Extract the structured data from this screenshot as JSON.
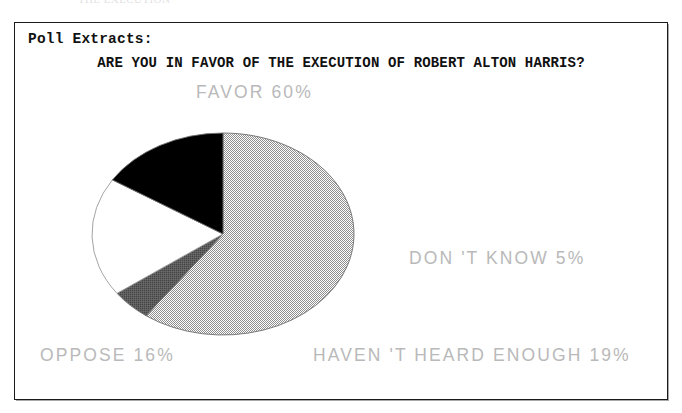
{
  "page": {
    "clipped_header_text": "THE EXECUTION"
  },
  "panel": {
    "section_label": "Poll Extracts:",
    "question": "ARE YOU IN FAVOR OF THE EXECUTION OF ROBERT ALTON HARRIS?"
  },
  "labels": {
    "favor": "FAVOR 60%",
    "dont_know": "DON 'T KNOW 5%",
    "oppose": "OPPOSE 16%",
    "havent_heard_enough": "HAVEN 'T HEARD ENOUGH 19%"
  },
  "chart_data": {
    "type": "pie",
    "title": "ARE YOU IN FAVOR OF THE EXECUTION OF ROBERT ALTON HARRIS?",
    "xlabel": "",
    "ylabel": "",
    "grid": false,
    "legend": "none",
    "value_unit": "percent",
    "total": 100,
    "center": [
      223,
      234
    ],
    "radius_x": 131,
    "radius_y": 101,
    "start_angle_deg": 0,
    "direction": "clockwise",
    "categories": [
      "FAVOR",
      "DON'T KNOW",
      "HAVEN'T HEARD ENOUGH",
      "OPPOSE"
    ],
    "values": [
      60,
      5,
      19,
      16
    ],
    "slices": [
      {
        "name": "FAVOR",
        "label": "FAVOR 60%",
        "value": 60,
        "fill": "#bdbdbd",
        "fill_style": "light-gray-dither",
        "start_deg": 0,
        "end_deg": 216
      },
      {
        "name": "DON'T KNOW",
        "label": "DON 'T KNOW 5%",
        "value": 5,
        "fill": "#5a5a5a",
        "fill_style": "dark-gray-solid",
        "start_deg": 216,
        "end_deg": 234
      },
      {
        "name": "HAVEN'T HEARD ENOUGH",
        "label": "HAVEN 'T HEARD ENOUGH 19%",
        "value": 19,
        "fill": "#ffffff",
        "fill_style": "white-solid",
        "start_deg": 234,
        "end_deg": 302.4
      },
      {
        "name": "OPPOSE",
        "label": "OPPOSE 16%",
        "value": 16,
        "fill": "#000000",
        "fill_style": "black-solid",
        "start_deg": 302.4,
        "end_deg": 360
      }
    ],
    "colors": {
      "favor": "#bdbdbd",
      "dont_know": "#5a5a5a",
      "havent_heard_enough": "#ffffff",
      "oppose": "#000000",
      "outline": "#888888",
      "label_text": "#b9b9b9",
      "heading_text": "#111111",
      "frame_border": "#1a1a1a"
    }
  }
}
